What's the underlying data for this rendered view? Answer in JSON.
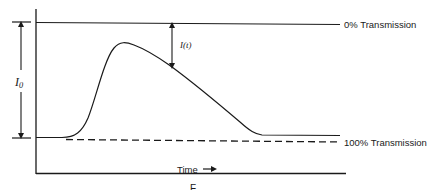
{
  "diagram": {
    "type": "absorbance-transient-trace",
    "labels": {
      "top_line": "0% Transmission",
      "baseline": "100% Transmission",
      "x_axis": "Time",
      "x_axis_arrow": "→",
      "i_zero_main": "I",
      "i_zero_sub": "0",
      "i_t": "I(t)",
      "caption_partial": "F"
    },
    "elements": [
      {
        "id": "y-axis",
        "kind": "solid-line"
      },
      {
        "id": "x-axis",
        "kind": "solid-line"
      },
      {
        "id": "zero-transmission-line",
        "kind": "solid-line",
        "label": "0% Transmission"
      },
      {
        "id": "full-transmission-line",
        "kind": "dashed-line",
        "label": "100% Transmission"
      },
      {
        "id": "signal-curve",
        "kind": "curve",
        "description": "rises from baseline to a peak then decays back to slightly above baseline"
      },
      {
        "id": "i-zero-arrow",
        "kind": "double-arrow",
        "label": "I0",
        "spans": "0% to 100% transmission"
      },
      {
        "id": "i-t-arrow",
        "kind": "double-arrow",
        "label": "I(t)",
        "spans": "0% line to curve"
      }
    ],
    "colors": {
      "ink": "#1a1a1a",
      "background": "#ffffff"
    }
  }
}
